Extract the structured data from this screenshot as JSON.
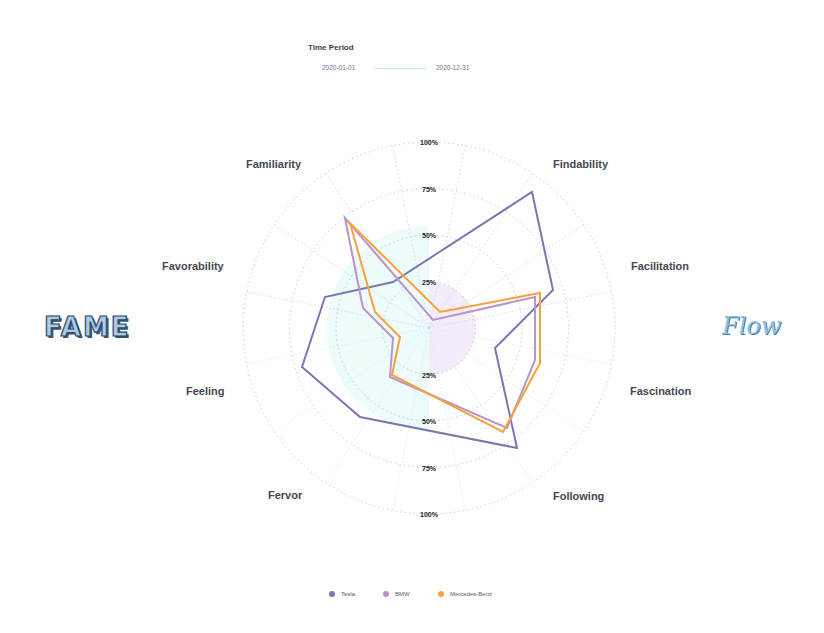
{
  "time_period": {
    "title": "Time Period",
    "start": "2020-01-01",
    "end": "2020-12-31"
  },
  "side_labels": {
    "left": "FAME",
    "right": "Flow"
  },
  "axes": [
    "Findability",
    "Facilitation",
    "Fascination",
    "Following",
    "Fervor",
    "Feeling",
    "Favorability",
    "Familiarity"
  ],
  "ticks": {
    "upper": [
      "100%",
      "75%",
      "50%",
      "25%"
    ],
    "lower": [
      "25%",
      "50%",
      "75%",
      "100%"
    ]
  },
  "legend": [
    {
      "name": "Tesla",
      "color": "#7b78b0"
    },
    {
      "name": "BMW",
      "color": "#b994c8"
    },
    {
      "name": "Mercedes-Benz",
      "color": "#f5a23c"
    }
  ],
  "chart_data": {
    "type": "radar",
    "title": "",
    "categories": [
      "Findability",
      "Facilitation",
      "Fascination",
      "Following",
      "Fervor",
      "Feeling",
      "Favorability",
      "Familiarity"
    ],
    "ylim": [
      0,
      100
    ],
    "tick_labels": [
      "25%",
      "50%",
      "75%",
      "100%"
    ],
    "grid": true,
    "legend_position": "bottom",
    "series": [
      {
        "name": "Tesla",
        "color": "#7b78b0",
        "points": [
          [
            532,
            192
          ],
          [
            553,
            290
          ],
          [
            495,
            348
          ],
          [
            517,
            448
          ],
          [
            360,
            417
          ],
          [
            302,
            367
          ],
          [
            325,
            297
          ],
          [
            393,
            282
          ]
        ]
      },
      {
        "name": "BMW",
        "color": "#b994c8",
        "points": [
          [
            345,
            218
          ],
          [
            363,
            308
          ],
          [
            393,
            338
          ],
          [
            390,
            377
          ],
          [
            507,
            428
          ],
          [
            535,
            360
          ],
          [
            535,
            297
          ],
          [
            433,
            320
          ]
        ]
      },
      {
        "name": "Mercedes-Benz",
        "color": "#f5a23c",
        "points": [
          [
            350,
            223
          ],
          [
            375,
            312
          ],
          [
            400,
            337
          ],
          [
            392,
            375
          ],
          [
            503,
            432
          ],
          [
            540,
            363
          ],
          [
            540,
            293
          ],
          [
            440,
            312
          ]
        ]
      }
    ]
  }
}
